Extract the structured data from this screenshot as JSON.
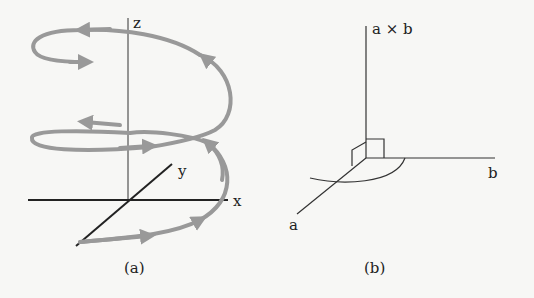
{
  "figure_a": {
    "caption": "(a)",
    "axis_labels": {
      "z": "z",
      "y": "y",
      "x": "x"
    },
    "curve": "helix",
    "curve_color": "#999999"
  },
  "figure_b": {
    "caption": "(b)",
    "axis_labels": {
      "cross": "a × b",
      "b": "b",
      "a": "a"
    }
  },
  "colors": {
    "background": "#f7f7f5",
    "axis": "#222222",
    "helix": "#999999"
  }
}
